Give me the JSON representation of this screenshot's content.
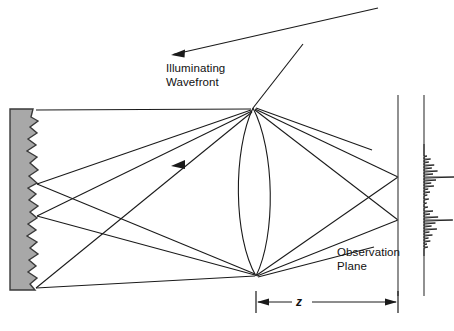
{
  "figure": {
    "kind": "optical-ray-diagram",
    "title_visible": false,
    "background_color": "#ffffff",
    "line_color": "#1a1a1a",
    "surface_fill_color": "#a8a8a8",
    "surface_stroke_color": "#333333"
  },
  "labels": {
    "illuminating_wavefront": "Illuminating\nWavefront",
    "observation_plane": "Observation\nPlane",
    "distance_z": "z"
  },
  "elements": {
    "rough_surface_name": "rough-scattering-surface",
    "lens_name": "biconvex-lens",
    "observation_plane_name": "observation-plane-line",
    "intensity_plot_name": "speckle-intensity-profile",
    "dimension_name": "z-dimension-arrow"
  },
  "chart_data": {
    "type": "line",
    "xlabel": "Intensity",
    "ylabel": "Observation plane position",
    "orientation": "horizontal-spikes-on-vertical-axis",
    "grid": false,
    "legend": false,
    "axis_x_px": 424,
    "ylim": [
      150,
      250
    ],
    "xlim": [
      0,
      1
    ],
    "spikes": [
      {
        "y": 156,
        "value": 0.1
      },
      {
        "y": 159,
        "value": 0.22
      },
      {
        "y": 162,
        "value": 0.16
      },
      {
        "y": 165,
        "value": 0.34
      },
      {
        "y": 168,
        "value": 0.26
      },
      {
        "y": 171,
        "value": 0.45
      },
      {
        "y": 174,
        "value": 0.3
      },
      {
        "y": 177,
        "value": 1.0
      },
      {
        "y": 180,
        "value": 0.4
      },
      {
        "y": 183,
        "value": 0.24
      },
      {
        "y": 186,
        "value": 0.33
      },
      {
        "y": 189,
        "value": 0.14
      },
      {
        "y": 192,
        "value": 0.2
      },
      {
        "y": 195,
        "value": 0.11
      },
      {
        "y": 199,
        "value": 0.16
      },
      {
        "y": 203,
        "value": 0.09
      },
      {
        "y": 207,
        "value": 0.13
      },
      {
        "y": 211,
        "value": 0.3
      },
      {
        "y": 214,
        "value": 0.2
      },
      {
        "y": 217,
        "value": 0.47
      },
      {
        "y": 220,
        "value": 0.96
      },
      {
        "y": 223,
        "value": 0.38
      },
      {
        "y": 226,
        "value": 0.25
      },
      {
        "y": 229,
        "value": 0.43
      },
      {
        "y": 232,
        "value": 0.18
      },
      {
        "y": 235,
        "value": 0.28
      },
      {
        "y": 238,
        "value": 0.15
      },
      {
        "y": 241,
        "value": 0.21
      },
      {
        "y": 244,
        "value": 0.1
      },
      {
        "y": 247,
        "value": 0.13
      }
    ]
  },
  "geometry": {
    "surface": {
      "left_x": 10,
      "right_base_x": 36,
      "top_y": 109,
      "bottom_y": 290,
      "jag_points": "zigzag"
    },
    "lens": {
      "top_apex": [
        253,
        108
      ],
      "bottom_apex": [
        256,
        276
      ],
      "half_width": 17
    },
    "observation_plane_x": 398,
    "intensity_axis_x": 424,
    "focus_points": [
      [
        398,
        177
      ],
      [
        398,
        220
      ]
    ],
    "scatter_points": [
      [
        37,
        110
      ],
      [
        37,
        184
      ],
      [
        37,
        216
      ],
      [
        37,
        288
      ]
    ],
    "illumination_arrow": {
      "from": [
        378,
        8
      ],
      "to": [
        171,
        55
      ]
    },
    "second_ray": {
      "from": [
        300,
        48
      ],
      "to": [
        253,
        108
      ]
    },
    "z_arrow": {
      "y": 302,
      "x_left": 256,
      "x_right": 398
    }
  }
}
